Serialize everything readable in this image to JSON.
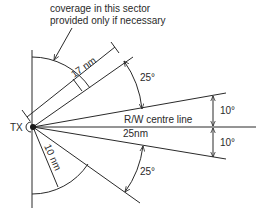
{
  "diagram": {
    "note": {
      "line1": "coverage in this sector",
      "line2": "provided only if necessary"
    },
    "transmitter_label": "TX",
    "centre_line_label": "R/W centre line",
    "centre_line_range": "25nm",
    "upper_range": "17 nm",
    "lower_range": "10 nm",
    "angles": {
      "upper_outer": "25°",
      "upper_inner": "10°",
      "lower_inner": "10°",
      "lower_outer": "25°"
    },
    "line_color": "#2a2a2a",
    "background": "#ffffff"
  }
}
